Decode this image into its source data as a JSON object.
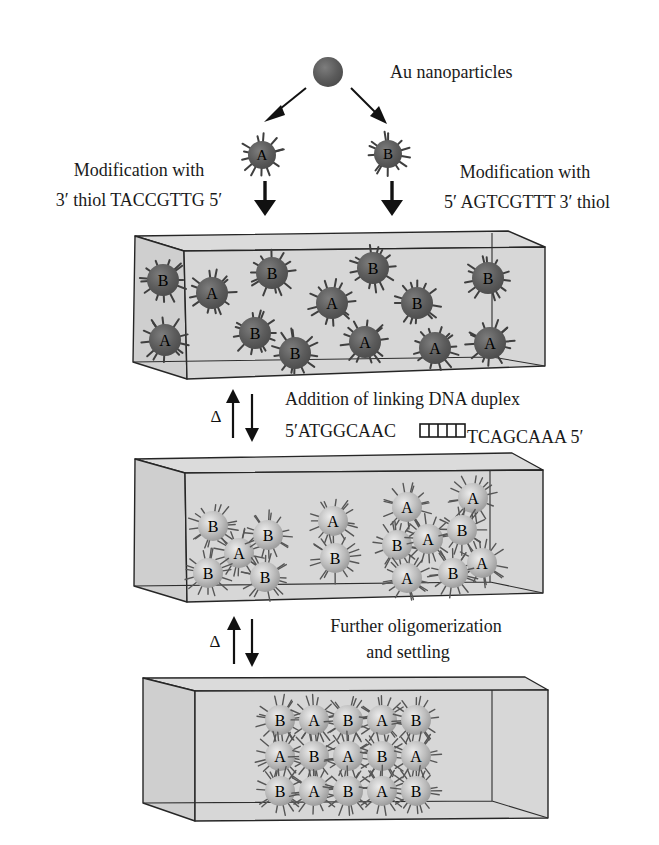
{
  "colors": {
    "background": "#ffffff",
    "box_fill": "#d7d7d7",
    "box_top_fill": "#dbdbdb",
    "box_left_fill": "#cfcfcf",
    "outline": "#262626",
    "dark_particle": "#5c5c5c",
    "light_particle": "#b7b7b7",
    "text": "#1a1a1a"
  },
  "figure": {
    "au": {
      "label": "Au nanoparticles"
    },
    "left_modification": {
      "line1": "Modification with",
      "line2": "3′ thiol TACCGTTG 5′"
    },
    "right_modification": {
      "line1": "Modification with",
      "line2": "5′ AGTCGTTT 3′ thiol"
    },
    "linking_step": {
      "delta": "Δ",
      "title": "Addition of linking DNA duplex",
      "strand_left": "5′ATGGCAAC",
      "strand_right": "TCAGCAAA 5′",
      "duplex_symbol": "ladder-icon"
    },
    "settling_step": {
      "delta": "Δ",
      "line1": "Further oligomerization",
      "line2": "and settling"
    },
    "styles": {
      "dark": {
        "gradient": "gradDark",
        "spikes": 13,
        "spike_min": 4,
        "spike_max": 9,
        "spike_width": 2,
        "spike_color": "#3f3f3f"
      },
      "light": {
        "gradient": "gradLight",
        "spikes": 16,
        "spike_min": 6,
        "spike_max": 11,
        "spike_width": 1.4,
        "spike_color": "#565656"
      }
    },
    "particle_groups": [
      {
        "container": "seed-particles",
        "style": "dark",
        "radius": 14,
        "font_size": 15,
        "particles": [
          {
            "x": 262,
            "y": 155,
            "label": "A"
          },
          {
            "x": 388,
            "y": 154,
            "label": "B"
          }
        ]
      },
      {
        "container": "box1-particles",
        "style": "dark",
        "radius": 16,
        "font_size": 16,
        "particles": [
          {
            "x": 163,
            "y": 280,
            "label": "B"
          },
          {
            "x": 212,
            "y": 293,
            "label": "A"
          },
          {
            "x": 272,
            "y": 273,
            "label": "B"
          },
          {
            "x": 332,
            "y": 303,
            "label": "A"
          },
          {
            "x": 373,
            "y": 268,
            "label": "B"
          },
          {
            "x": 417,
            "y": 303,
            "label": "B"
          },
          {
            "x": 488,
            "y": 278,
            "label": "B"
          },
          {
            "x": 165,
            "y": 340,
            "label": "A"
          },
          {
            "x": 255,
            "y": 333,
            "label": "B"
          },
          {
            "x": 295,
            "y": 353,
            "label": "B"
          },
          {
            "x": 365,
            "y": 342,
            "label": "A"
          },
          {
            "x": 435,
            "y": 348,
            "label": "A"
          },
          {
            "x": 490,
            "y": 343,
            "label": "A"
          }
        ]
      },
      {
        "container": "box2-particles",
        "style": "light",
        "radius": 15,
        "font_size": 16,
        "particles": [
          {
            "x": 213,
            "y": 526,
            "label": "B"
          },
          {
            "x": 239,
            "y": 553,
            "label": "A"
          },
          {
            "x": 268,
            "y": 535,
            "label": "B"
          },
          {
            "x": 208,
            "y": 573,
            "label": "B"
          },
          {
            "x": 265,
            "y": 577,
            "label": "B"
          },
          {
            "x": 333,
            "y": 521,
            "label": "A"
          },
          {
            "x": 335,
            "y": 558,
            "label": "B"
          },
          {
            "x": 407,
            "y": 507,
            "label": "A"
          },
          {
            "x": 473,
            "y": 498,
            "label": "A"
          },
          {
            "x": 397,
            "y": 545,
            "label": "B"
          },
          {
            "x": 428,
            "y": 539,
            "label": "A"
          },
          {
            "x": 462,
            "y": 530,
            "label": "B"
          },
          {
            "x": 482,
            "y": 563,
            "label": "A"
          },
          {
            "x": 407,
            "y": 578,
            "label": "A"
          },
          {
            "x": 453,
            "y": 573,
            "label": "B"
          }
        ]
      },
      {
        "container": "box3-particles",
        "style": "light",
        "radius": 15,
        "font_size": 16,
        "particles": [
          {
            "x": 280,
            "y": 720,
            "label": "B"
          },
          {
            "x": 314,
            "y": 720,
            "label": "A"
          },
          {
            "x": 348,
            "y": 720,
            "label": "B"
          },
          {
            "x": 382,
            "y": 720,
            "label": "A"
          },
          {
            "x": 416,
            "y": 720,
            "label": "B"
          },
          {
            "x": 280,
            "y": 756,
            "label": "A"
          },
          {
            "x": 314,
            "y": 756,
            "label": "B"
          },
          {
            "x": 348,
            "y": 756,
            "label": "A"
          },
          {
            "x": 382,
            "y": 756,
            "label": "B"
          },
          {
            "x": 416,
            "y": 756,
            "label": "A"
          },
          {
            "x": 280,
            "y": 791,
            "label": "B"
          },
          {
            "x": 314,
            "y": 791,
            "label": "A"
          },
          {
            "x": 348,
            "y": 791,
            "label": "B"
          },
          {
            "x": 382,
            "y": 791,
            "label": "A"
          },
          {
            "x": 416,
            "y": 791,
            "label": "B"
          }
        ]
      }
    ]
  }
}
